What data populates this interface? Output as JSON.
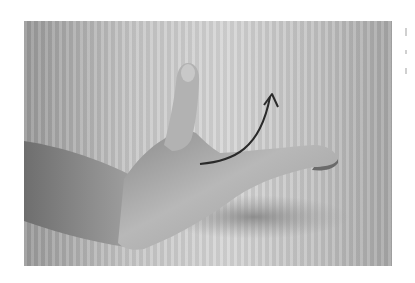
{
  "image": {
    "description": "Grayscale photograph of a hand with thumb raised and index finger extended, with a curved arrow indicating upward motion of the index finger",
    "annotation": {
      "type": "curved-arrow",
      "direction": "up",
      "color": "#2a2a2a"
    },
    "colors": {
      "background": "#ffffff",
      "wall": "#cfcfcf",
      "skin_light": "#b4b4b4",
      "skin_dark": "#7a7a7a",
      "shadow": "#8f8f8f"
    }
  }
}
